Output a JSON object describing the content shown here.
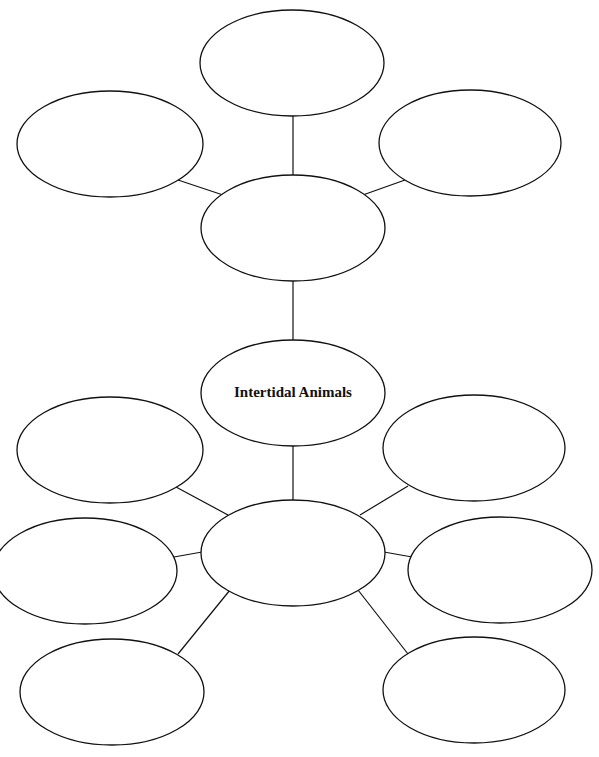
{
  "diagram": {
    "type": "double concept web (graphic organizer)",
    "center_label": "Intertidal Animals",
    "line_color": "#111111",
    "background": "#ffffff",
    "heading_note": "Top line of instruction text is cropped and illegible",
    "upper_web": {
      "hub": {
        "id": "upper-hub",
        "label": ""
      },
      "branches": [
        {
          "id": "upper-top",
          "label": ""
        },
        {
          "id": "upper-left",
          "label": ""
        },
        {
          "id": "upper-right",
          "label": ""
        }
      ]
    },
    "lower_web": {
      "hub": {
        "id": "lower-hub",
        "label": ""
      },
      "branches": [
        {
          "id": "lower-upper-left",
          "label": ""
        },
        {
          "id": "lower-upper-right",
          "label": ""
        },
        {
          "id": "lower-mid-left",
          "label": ""
        },
        {
          "id": "lower-mid-right",
          "label": ""
        },
        {
          "id": "lower-bottom-left",
          "label": ""
        },
        {
          "id": "lower-bottom-right",
          "label": ""
        }
      ]
    }
  }
}
